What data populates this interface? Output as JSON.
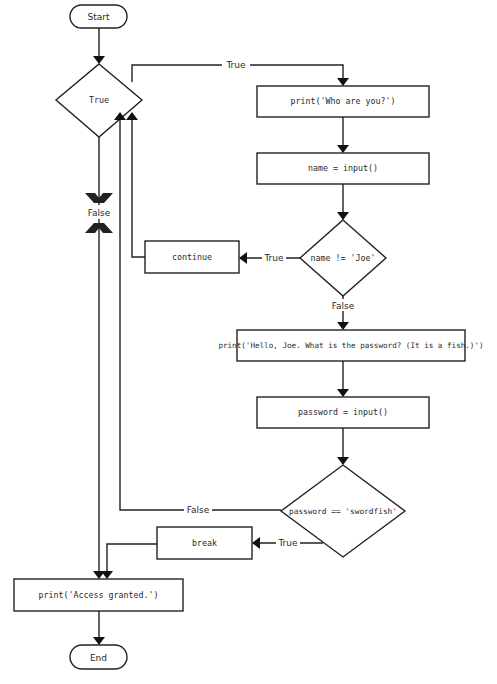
{
  "flowchart": {
    "start": {
      "label": "Start"
    },
    "end": {
      "label": "End"
    },
    "loop_condition": {
      "label": "True"
    },
    "nodes": {
      "print_who": {
        "label": "print('Who are you?')"
      },
      "name_input": {
        "label": "name = input()"
      },
      "name_check": {
        "label": "name != 'Joe'"
      },
      "continue_box": {
        "label": "continue"
      },
      "print_hello": {
        "label": "print('Hello, Joe. What is the password? (It is a fish.)')"
      },
      "password_input": {
        "label": "password = input()"
      },
      "password_check": {
        "label": "password == 'swordfish'"
      },
      "break_box": {
        "label": "break"
      },
      "print_granted": {
        "label": "print('Access granted.')"
      }
    },
    "edge_labels": {
      "loop_true": "True",
      "loop_false": "False",
      "name_true": "True",
      "name_false": "False",
      "password_false": "False",
      "password_true": "True"
    }
  }
}
